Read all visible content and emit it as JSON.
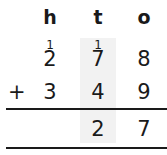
{
  "headers": [
    "h",
    "t",
    "o"
  ],
  "carries": {
    "h": "1",
    "t": "1"
  },
  "rows": [
    {
      "h": "2",
      "t": "7",
      "o": "8"
    },
    {
      "h": "3",
      "t": "4",
      "o": "9"
    }
  ],
  "operator": "+",
  "result": {
    "t": "2",
    "o": "7"
  },
  "colors": {
    "shaded_column": "#f2f2f2",
    "text": "#1a1a1a"
  }
}
